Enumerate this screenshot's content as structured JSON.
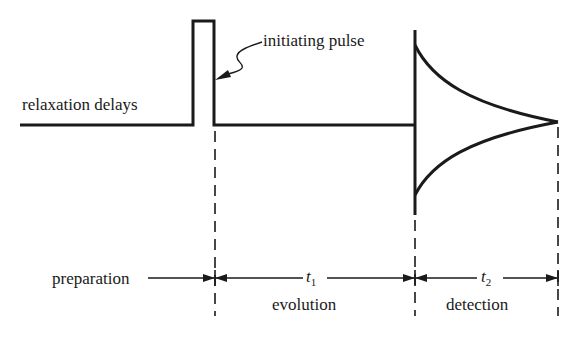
{
  "diagram": {
    "labels": {
      "relaxation": "relaxation delays",
      "pulse": "initiating pulse",
      "preparation": "preparation",
      "evolution": "evolution",
      "detection": "detection",
      "t1_var": "t",
      "t1_sub": "1",
      "t2_var": "t",
      "t2_sub": "2"
    },
    "periods": [
      {
        "name": "preparation",
        "interval": ""
      },
      {
        "name": "evolution",
        "interval": "t1"
      },
      {
        "name": "detection",
        "interval": "t2"
      }
    ],
    "colors": {
      "ink": "#1a1a1a",
      "background": "#ffffff"
    }
  }
}
